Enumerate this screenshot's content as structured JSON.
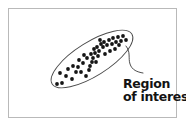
{
  "figure": {
    "type": "scatter-with-region-annotation",
    "background_color": "#ffffff",
    "frame": {
      "name": "figure-border",
      "color": "#b9b9b9",
      "x": 8,
      "y": 8,
      "width": 169,
      "height": 110
    },
    "annotation": {
      "line1": "Region",
      "line2": "of interest",
      "color": "#131313"
    },
    "leader_line": {
      "name": "callout-leader-line",
      "color": "#3a3a3a",
      "path": "M126,46 C131,52 128,58 130,64 C132,70 137,72 143,73"
    }
  },
  "chart_data": {
    "type": "scatter",
    "title": "",
    "subtitle": "",
    "xlabel": "",
    "ylabel": "",
    "xlim": [
      0,
      186
    ],
    "ylim": [
      0,
      127
    ],
    "grid": false,
    "legend": null,
    "axes_visible": false,
    "annotations": [
      {
        "text": "Region of interest",
        "x": 123,
        "y": 78,
        "bold": true,
        "points_to": "highlight-ellipse"
      }
    ],
    "region_of_interest": {
      "shape": "ellipse",
      "center_x": 92,
      "center_y": 59,
      "semi_major": 47,
      "semi_minor": 17,
      "rotation_deg": -32,
      "stroke": "#4a4a4a",
      "stroke_width": 0.9,
      "fill": "none"
    },
    "marker": {
      "shape": "circle",
      "radius": 1.9,
      "color": "#151515"
    },
    "points": [
      [
        57,
        84
      ],
      [
        62,
        83
      ],
      [
        66,
        76
      ],
      [
        60,
        73
      ],
      [
        72,
        79
      ],
      [
        76,
        72
      ],
      [
        68,
        69
      ],
      [
        73,
        66
      ],
      [
        78,
        67
      ],
      [
        81,
        72
      ],
      [
        83,
        63
      ],
      [
        79,
        60
      ],
      [
        86,
        76
      ],
      [
        89,
        70
      ],
      [
        90,
        66
      ],
      [
        92,
        62
      ],
      [
        93,
        58
      ],
      [
        91,
        54
      ],
      [
        95,
        53
      ],
      [
        94,
        49
      ],
      [
        97,
        47
      ],
      [
        99,
        51
      ],
      [
        98,
        56
      ],
      [
        101,
        44
      ],
      [
        100,
        40
      ],
      [
        104,
        42
      ],
      [
        103,
        47
      ],
      [
        107,
        45
      ],
      [
        109,
        40
      ],
      [
        112,
        44
      ],
      [
        113,
        38
      ],
      [
        116,
        42
      ],
      [
        118,
        37
      ],
      [
        121,
        41
      ],
      [
        123,
        36
      ],
      [
        126,
        40
      ],
      [
        110,
        51
      ],
      [
        115,
        49
      ],
      [
        105,
        54
      ],
      [
        119,
        45
      ],
      [
        87,
        58
      ],
      [
        84,
        55
      ],
      [
        96,
        62
      ]
    ]
  }
}
